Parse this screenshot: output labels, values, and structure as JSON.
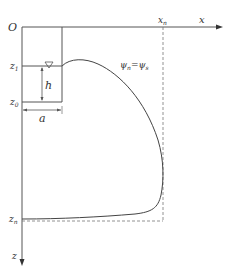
{
  "diagram": {
    "type": "seepage-profile",
    "axes": {
      "origin_label": "O",
      "x_label": "x",
      "z_label": "z",
      "xn_label": "x",
      "xn_sub": "n",
      "zn_label": "z",
      "zn_sub": "n"
    },
    "levels": {
      "z1_label": "z",
      "z1_sub": "1",
      "z0_label": "z",
      "z0_sub": "0"
    },
    "dimensions": {
      "h_label": "h",
      "a_label": "a"
    },
    "curve_label": {
      "psi_n": "ψ",
      "psi_n_sub": "n",
      "equals": "=",
      "psi_s": "ψ",
      "psi_s_sub": "s"
    },
    "water_level_symbol": "▽",
    "colors": {
      "line": "#555555",
      "dashed": "#777777",
      "text": "#333333"
    }
  }
}
